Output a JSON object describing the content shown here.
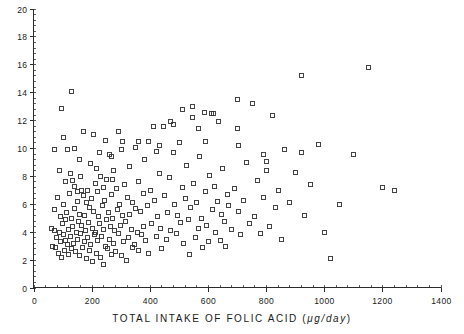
{
  "chart_data": {
    "type": "scatter",
    "title": "",
    "xlabel": "TOTAL  INTAKE  OF  FOLIC  ACID  (",
    "xlabel_unit": "μg/day",
    "xlabel_tail": ")",
    "ylabel": "",
    "xlim": [
      0,
      1400
    ],
    "ylim": [
      0,
      20
    ],
    "xticks": [
      0,
      200,
      400,
      600,
      800,
      1000,
      1200,
      1400
    ],
    "xtick_labels": [
      "0",
      "200",
      "400",
      "600",
      "800",
      "1000",
      "1200",
      "1400"
    ],
    "yticks": [
      0,
      2,
      4,
      6,
      8,
      10,
      12,
      14,
      16,
      18,
      20
    ],
    "ytick_labels": [
      "0",
      "2",
      "4",
      "6",
      "8",
      "10",
      "12",
      "14",
      "16",
      "18",
      "20"
    ],
    "x_minor_interval": 40,
    "y_minor_interval": 0.4,
    "grid": false,
    "legend": null,
    "marker": "open-square",
    "marker_size_px": 4,
    "marker_color": "#2f2f2f",
    "points": [
      [
        60,
        4.3
      ],
      [
        62,
        3.0
      ],
      [
        70,
        5.6
      ],
      [
        72,
        4.1
      ],
      [
        75,
        2.9
      ],
      [
        78,
        3.6
      ],
      [
        82,
        6.5
      ],
      [
        85,
        2.5
      ],
      [
        88,
        4.0
      ],
      [
        90,
        3.3
      ],
      [
        92,
        5.1
      ],
      [
        95,
        2.2
      ],
      [
        98,
        4.6
      ],
      [
        100,
        3.8
      ],
      [
        103,
        6.0
      ],
      [
        105,
        2.7
      ],
      [
        108,
        3.4
      ],
      [
        110,
        4.9
      ],
      [
        112,
        5.4
      ],
      [
        115,
        3.1
      ],
      [
        118,
        2.4
      ],
      [
        120,
        4.2
      ],
      [
        122,
        6.8
      ],
      [
        125,
        3.7
      ],
      [
        128,
        5.0
      ],
      [
        130,
        2.8
      ],
      [
        132,
        4.4
      ],
      [
        135,
        3.2
      ],
      [
        138,
        7.3
      ],
      [
        140,
        5.7
      ],
      [
        142,
        2.6
      ],
      [
        145,
        4.0
      ],
      [
        148,
        3.5
      ],
      [
        150,
        6.2
      ],
      [
        152,
        4.8
      ],
      [
        155,
        2.3
      ],
      [
        158,
        5.3
      ],
      [
        160,
        3.9
      ],
      [
        162,
        7.0
      ],
      [
        165,
        4.5
      ],
      [
        168,
        2.9
      ],
      [
        170,
        6.6
      ],
      [
        172,
        3.3
      ],
      [
        175,
        5.2
      ],
      [
        178,
        4.1
      ],
      [
        180,
        2.1
      ],
      [
        182,
        6.1
      ],
      [
        185,
        3.6
      ],
      [
        188,
        4.7
      ],
      [
        190,
        5.8
      ],
      [
        192,
        2.7
      ],
      [
        195,
        3.1
      ],
      [
        198,
        6.4
      ],
      [
        200,
        4.3
      ],
      [
        202,
        1.9
      ],
      [
        205,
        5.5
      ],
      [
        208,
        3.8
      ],
      [
        210,
        7.5
      ],
      [
        212,
        4.0
      ],
      [
        215,
        2.5
      ],
      [
        218,
        6.9
      ],
      [
        220,
        3.4
      ],
      [
        222,
        5.1
      ],
      [
        225,
        4.6
      ],
      [
        228,
        2.2
      ],
      [
        230,
        8.0
      ],
      [
        232,
        3.7
      ],
      [
        235,
        5.9
      ],
      [
        238,
        4.2
      ],
      [
        240,
        1.7
      ],
      [
        242,
        6.3
      ],
      [
        245,
        3.0
      ],
      [
        248,
        4.9
      ],
      [
        250,
        7.8
      ],
      [
        252,
        2.8
      ],
      [
        255,
        5.4
      ],
      [
        258,
        3.5
      ],
      [
        260,
        9.6
      ],
      [
        262,
        4.4
      ],
      [
        265,
        2.4
      ],
      [
        268,
        6.7
      ],
      [
        270,
        5.0
      ],
      [
        272,
        3.2
      ],
      [
        275,
        8.4
      ],
      [
        278,
        4.1
      ],
      [
        280,
        2.6
      ],
      [
        285,
        7.1
      ],
      [
        288,
        5.6
      ],
      [
        290,
        3.9
      ],
      [
        295,
        6.0
      ],
      [
        298,
        4.5
      ],
      [
        300,
        2.3
      ],
      [
        302,
        9.9
      ],
      [
        305,
        5.2
      ],
      [
        308,
        3.3
      ],
      [
        310,
        7.4
      ],
      [
        315,
        4.8
      ],
      [
        318,
        2.0
      ],
      [
        320,
        6.5
      ],
      [
        325,
        3.6
      ],
      [
        328,
        5.3
      ],
      [
        330,
        8.7
      ],
      [
        335,
        4.2
      ],
      [
        338,
        2.9
      ],
      [
        340,
        6.1
      ],
      [
        345,
        3.1
      ],
      [
        348,
        5.7
      ],
      [
        350,
        10.1
      ],
      [
        355,
        4.0
      ],
      [
        358,
        7.6
      ],
      [
        360,
        2.7
      ],
      [
        365,
        5.5
      ],
      [
        370,
        3.8
      ],
      [
        375,
        6.8
      ],
      [
        378,
        4.4
      ],
      [
        380,
        9.2
      ],
      [
        385,
        3.4
      ],
      [
        390,
        5.9
      ],
      [
        395,
        2.5
      ],
      [
        400,
        7.0
      ],
      [
        405,
        4.6
      ],
      [
        410,
        11.6
      ],
      [
        415,
        6.3
      ],
      [
        420,
        3.7
      ],
      [
        425,
        5.1
      ],
      [
        430,
        8.2
      ],
      [
        435,
        4.3
      ],
      [
        440,
        2.8
      ],
      [
        445,
        11.6
      ],
      [
        450,
        6.6
      ],
      [
        455,
        3.5
      ],
      [
        460,
        5.4
      ],
      [
        465,
        7.9
      ],
      [
        470,
        4.1
      ],
      [
        480,
        9.7
      ],
      [
        485,
        6.0
      ],
      [
        490,
        3.9
      ],
      [
        495,
        5.2
      ],
      [
        500,
        10.4
      ],
      [
        505,
        4.7
      ],
      [
        510,
        7.2
      ],
      [
        515,
        3.2
      ],
      [
        520,
        6.4
      ],
      [
        525,
        8.8
      ],
      [
        530,
        4.9
      ],
      [
        535,
        2.4
      ],
      [
        540,
        5.8
      ],
      [
        545,
        12.2
      ],
      [
        550,
        7.5
      ],
      [
        555,
        3.6
      ],
      [
        560,
        6.1
      ],
      [
        565,
        4.3
      ],
      [
        570,
        9.4
      ],
      [
        575,
        5.0
      ],
      [
        580,
        2.9
      ],
      [
        585,
        12.6
      ],
      [
        590,
        6.9
      ],
      [
        595,
        4.5
      ],
      [
        600,
        3.3
      ],
      [
        605,
        8.1
      ],
      [
        610,
        12.5
      ],
      [
        615,
        5.6
      ],
      [
        618,
        12.5
      ],
      [
        620,
        7.3
      ],
      [
        625,
        4.0
      ],
      [
        630,
        6.2
      ],
      [
        635,
        11.9
      ],
      [
        640,
        3.4
      ],
      [
        645,
        5.3
      ],
      [
        650,
        8.6
      ],
      [
        655,
        4.8
      ],
      [
        660,
        3.0
      ],
      [
        665,
        6.7
      ],
      [
        670,
        5.9
      ],
      [
        680,
        4.2
      ],
      [
        690,
        7.1
      ],
      [
        700,
        13.5
      ],
      [
        705,
        5.5
      ],
      [
        710,
        3.8
      ],
      [
        720,
        6.3
      ],
      [
        730,
        9.0
      ],
      [
        740,
        4.6
      ],
      [
        750,
        13.2
      ],
      [
        760,
        5.1
      ],
      [
        770,
        7.7
      ],
      [
        780,
        3.9
      ],
      [
        790,
        6.5
      ],
      [
        800,
        8.4
      ],
      [
        810,
        4.4
      ],
      [
        820,
        12.4
      ],
      [
        830,
        5.8
      ],
      [
        840,
        7.0
      ],
      [
        850,
        3.5
      ],
      [
        860,
        9.9
      ],
      [
        880,
        6.1
      ],
      [
        900,
        8.3
      ],
      [
        920,
        15.2
      ],
      [
        930,
        5.2
      ],
      [
        950,
        7.4
      ],
      [
        980,
        10.3
      ],
      [
        1000,
        4.0
      ],
      [
        1020,
        2.1
      ],
      [
        1050,
        6.0
      ],
      [
        1100,
        9.6
      ],
      [
        1150,
        15.8
      ],
      [
        1200,
        7.2
      ],
      [
        1240,
        7.0
      ],
      [
        130,
        14.1
      ],
      [
        95,
        12.9
      ],
      [
        100,
        10.8
      ],
      [
        170,
        11.2
      ],
      [
        205,
        11.0
      ],
      [
        290,
        11.2
      ],
      [
        305,
        10.5
      ],
      [
        245,
        10.6
      ],
      [
        115,
        9.9
      ],
      [
        140,
        10.0
      ],
      [
        72,
        9.9
      ],
      [
        88,
        8.4
      ],
      [
        155,
        9.2
      ],
      [
        225,
        9.7
      ],
      [
        265,
        9.4
      ],
      [
        195,
        8.9
      ],
      [
        215,
        8.6
      ],
      [
        160,
        8.0
      ],
      [
        125,
        8.2
      ],
      [
        108,
        7.6
      ],
      [
        360,
        10.5
      ],
      [
        395,
        10.5
      ],
      [
        420,
        9.8
      ],
      [
        430,
        10.2
      ],
      [
        470,
        11.9
      ],
      [
        480,
        11.7
      ],
      [
        510,
        12.8
      ],
      [
        545,
        13.0
      ],
      [
        565,
        11.4
      ],
      [
        590,
        10.5
      ],
      [
        700,
        11.4
      ],
      [
        705,
        10.2
      ],
      [
        790,
        9.6
      ],
      [
        800,
        9.1
      ],
      [
        920,
        9.7
      ],
      [
        270,
        7.8
      ],
      [
        240,
        7.2
      ],
      [
        185,
        7.0
      ],
      [
        150,
        6.9
      ],
      [
        133,
        7.7
      ]
    ]
  }
}
